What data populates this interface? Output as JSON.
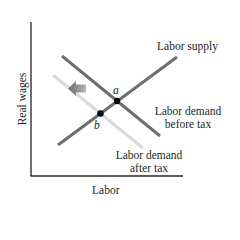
{
  "diagram": {
    "title": "",
    "axes": {
      "y_label": "Real wages",
      "x_label": "Labor"
    },
    "curves": {
      "supply": {
        "label": "Labor supply",
        "color": "#6d6e71"
      },
      "demand_before": {
        "label_line1": "Labor demand",
        "label_line2": "before tax",
        "color": "#6d6e71"
      },
      "demand_after": {
        "label_line1": "Labor demand",
        "label_line2": "after tax",
        "color": "#d9dadb"
      }
    },
    "points": {
      "a": "a",
      "b": "b"
    },
    "shift_arrow": {
      "direction": "left",
      "color": "#8c8c8c"
    },
    "colors": {
      "axis": "#231f20",
      "point": "#000000"
    }
  }
}
